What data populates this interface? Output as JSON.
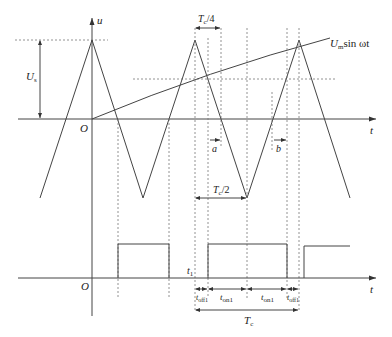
{
  "diagram": {
    "title": "",
    "type": "PWM regular-sampling waveform diagram",
    "colors": {
      "line": "#444444",
      "dotted": "#777777",
      "text": "#222222",
      "background": "#ffffff"
    },
    "axes": {
      "top": {
        "vertical_label": "u",
        "horizontal_label": "t",
        "origin_label": "O"
      },
      "bottom": {
        "horizontal_label": "t",
        "origin_label": "O"
      }
    },
    "labels": {
      "amplitude": "U",
      "amplitude_sub": "s",
      "quarter_period": "T",
      "quarter_period_sub": "c",
      "quarter_period_suffix": "/4",
      "half_period": "T",
      "half_period_sub": "c",
      "half_period_suffix": "/2",
      "sine_main": "U",
      "sine_sub": "m",
      "sine_suffix": "sin ωt",
      "a": "a",
      "b": "b",
      "t1": "t",
      "t1_sub": "1",
      "toff1_left": "t",
      "toff1_left_sub": "off1",
      "ton1_left": "t",
      "ton1_left_sub": "on1",
      "ton1_right": "t",
      "ton1_right_sub": "on1",
      "toff1_right": "t",
      "toff1_right_sub": "off1",
      "period": "T",
      "period_sub": "c"
    },
    "carrier_triangle_points": [
      [
        40,
        198
      ],
      [
        92,
        40
      ],
      [
        143,
        198
      ],
      [
        195,
        40
      ],
      [
        247,
        198
      ],
      [
        299,
        40
      ],
      [
        350,
        198
      ]
    ],
    "modulating_wave": "U_m sin ωt (rising from origin)",
    "pulse_intervals": [
      [
        118,
        169
      ],
      [
        208,
        287
      ],
      [
        304,
        350
      ]
    ],
    "dotted_verticals_x": [
      118,
      169,
      195,
      208,
      221,
      247,
      287,
      299
    ]
  }
}
